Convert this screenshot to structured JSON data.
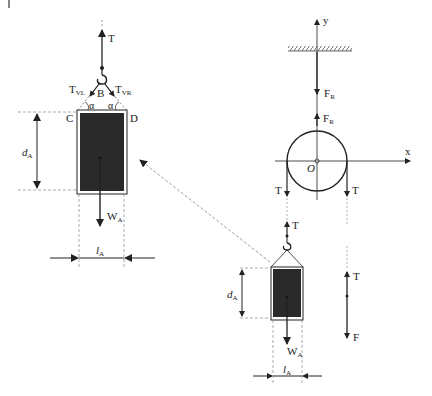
{
  "diagram": {
    "colors": {
      "line": "#222222",
      "block": "#2a2a2a",
      "dashed": "#888888"
    },
    "left_detail": {
      "rope_tension": "T",
      "hook_point": "B",
      "left_tension": {
        "main": "T",
        "sub": "VL"
      },
      "right_tension": {
        "main": "T",
        "sub": "VR"
      },
      "angle_left": "α",
      "angle_right": "α",
      "corner_left": "C",
      "corner_right": "D",
      "height_dim": {
        "main": "d",
        "sub": "A"
      },
      "width_dim": {
        "main": "l",
        "sub": "A"
      },
      "weight": {
        "main": "W",
        "sub": "A"
      }
    },
    "pulley": {
      "axis_y": "y",
      "axis_x": "x",
      "origin": "O",
      "reaction_down": {
        "main": "F",
        "sub": "R"
      },
      "reaction_up": {
        "main": "F",
        "sub": "R"
      },
      "tension_left": "T",
      "tension_right": "T"
    },
    "hanging_load": {
      "rope_tension": "T",
      "height_dim": {
        "main": "d",
        "sub": "A"
      },
      "width_dim": {
        "main": "l",
        "sub": "A"
      },
      "weight": {
        "main": "W",
        "sub": "A"
      }
    },
    "free_end": {
      "tension": "T",
      "applied_force": "F"
    }
  }
}
